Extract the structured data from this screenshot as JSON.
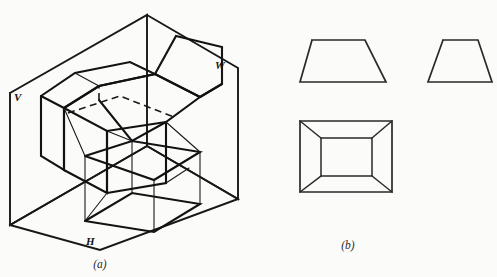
{
  "figure": {
    "background_color": "#fbfbfa",
    "line_color": "#181818",
    "captions": {
      "left": "(a)",
      "right": "(b)"
    },
    "plane_labels": {
      "vertical": "V",
      "horizontal": "H",
      "profile": "W"
    },
    "panel_a": {
      "name": "pictorial-projection-box",
      "description": "Isometric view of three mutually perpendicular projection planes V, H and W with a hollow truncated pyramid and its three projections",
      "planes": [
        {
          "id": "vertical-plane",
          "label": "V",
          "label_x": 14,
          "label_y": 101,
          "outline": "10,93 147,15 147,146 10,225"
        },
        {
          "id": "horizontal-plane",
          "label": "H",
          "label_x": 88,
          "label_y": 245,
          "outline": "10,225 147,146 238,199 100,250"
        },
        {
          "id": "profile-plane",
          "label": "W",
          "label_x": 218,
          "label_y": 69,
          "outline": "147,15 238,68 238,199 147,146"
        }
      ],
      "solid_edges": [
        "64,108 99,86 155,74 200,97 166,122 107,131 64,108",
        "107,131 107,193 64,170 64,108",
        "166,122 166,183 107,193",
        "99,86 99,100",
        "155,74 155,88",
        "64,108 41,96 41,156 64,170",
        "107,193 85,221 85,156",
        "166,183 189,166",
        "85,221 154,232 200,204 132,193 85,221",
        "132,193 132,141 85,156 85,221",
        "154,232 154,180 200,152 200,204",
        "99,100 132,141 166,122",
        "107,131 132,141",
        "64,108 85,156",
        "166,122 200,152",
        "99,86 64,108",
        "155,74 200,97"
      ],
      "hidden_edges": [
        "68,113 120,96 174,117",
        "99,100 155,88 155,74"
      ],
      "thin_projector_lines": [
        "99,86 99,100",
        "107,131 107,193",
        "166,122 166,183",
        "64,108 64,170",
        "85,156 85,221",
        "132,141 132,193",
        "200,152 200,204",
        "154,180 154,232",
        "41,96 41,156"
      ]
    },
    "panel_b": {
      "name": "orthographic-views",
      "description": "Three standard orthographic views of the same object",
      "views": [
        {
          "id": "front-view",
          "shape": "trapezoid",
          "outline": "312,40 365,40 386,82 300,82 312,40"
        },
        {
          "id": "side-view",
          "shape": "trapezoid",
          "outline": "443,40 478,40 492,82 428,82 443,40"
        },
        {
          "id": "top-view",
          "shape": "nested-rectangles",
          "outer": "300,121 392,121 392,192 300,192 300,121",
          "inner": "321,138 372,138 372,176 321,176 321,138",
          "diagonals": [
            "300,121 321,138",
            "392,121 372,138",
            "392,192 372,176",
            "300,192 321,176"
          ]
        }
      ]
    }
  }
}
